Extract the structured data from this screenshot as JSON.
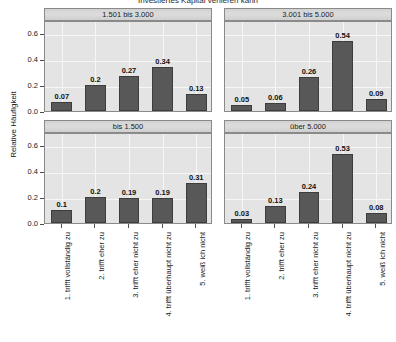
{
  "chart_data": {
    "type": "bar",
    "title": "Investiertes Kapital verlieren kann",
    "xlabel": "",
    "ylabel": "Relative Häufigkeit",
    "ylim": [
      0,
      0.7
    ],
    "yticks": [
      "0.0",
      "0.2",
      "0.4",
      "0.6"
    ],
    "ytick_values": [
      0.0,
      0.2,
      0.4,
      0.6
    ],
    "grid": true,
    "legend": "none",
    "layout": "2x2 facet grid",
    "categories": [
      "1. trifft vollständig zu",
      "2. trifft eher zu",
      "3. trifft eher nicht zu",
      "4. trifft überhaupt nicht zu",
      "5. weiß ich nicht"
    ],
    "panels": [
      {
        "title": "1.501 bis 3.000",
        "position": "top-left",
        "values": [
          0.07,
          0.2,
          0.27,
          0.34,
          0.13
        ],
        "labels": [
          "0.07",
          "0.2",
          "0.27",
          "0.34",
          "0.13"
        ]
      },
      {
        "title": "3.001 bis 5.000",
        "position": "top-right",
        "values": [
          0.05,
          0.06,
          0.26,
          0.54,
          0.09
        ],
        "labels": [
          "0.05",
          "0.06",
          "0.26",
          "0.54",
          "0.09"
        ]
      },
      {
        "title": "bis 1.500",
        "position": "bottom-left",
        "values": [
          0.1,
          0.2,
          0.19,
          0.19,
          0.31
        ],
        "labels": [
          "0.1",
          "0.2",
          "0.19",
          "0.19",
          "0.31"
        ]
      },
      {
        "title": "über 5.000",
        "position": "bottom-right",
        "values": [
          0.03,
          0.13,
          0.24,
          0.53,
          0.08
        ],
        "labels": [
          "0.03",
          "0.13",
          "0.24",
          "0.53",
          "0.08"
        ]
      }
    ],
    "colors": {
      "bar_fill": "#585858",
      "bar_border": "#3d3d3d",
      "panel_background": "#e4e4e4",
      "strip_background": "#d6d6d6",
      "gridline": "#f7f7f7",
      "axis": "#4d4d4d",
      "text": "#1a1a1a",
      "page_background": "#ffffff"
    }
  }
}
